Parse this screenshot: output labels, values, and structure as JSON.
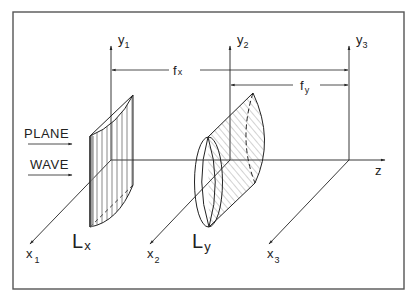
{
  "figure": {
    "frame": {
      "x": 13,
      "y": 12,
      "width": 391,
      "height": 277
    },
    "colors": {
      "ink": "#222222",
      "paper": "#ffffff",
      "frame": "#555555",
      "hatch": "#555555"
    },
    "incident_label": {
      "line1": "PLANE",
      "line2": "WAVE"
    },
    "axes": {
      "y1": {
        "base": "y",
        "sub": "1"
      },
      "y2": {
        "base": "y",
        "sub": "2"
      },
      "y3": {
        "base": "y",
        "sub": "3"
      },
      "x1": {
        "base": "x",
        "sub": "1"
      },
      "x2": {
        "base": "x",
        "sub": "2"
      },
      "x3": {
        "base": "x",
        "sub": "3"
      },
      "z": {
        "label": "z"
      }
    },
    "dimensions": {
      "fx": {
        "base": "f",
        "sub": "x"
      },
      "fy": {
        "base": "f",
        "sub": "y"
      }
    },
    "lenses": {
      "Lx": {
        "base": "L",
        "sub": "x",
        "type": "cylindrical lens focusing in x"
      },
      "Ly": {
        "base": "L",
        "sub": "y",
        "type": "cylindrical lens focusing in y"
      }
    }
  }
}
